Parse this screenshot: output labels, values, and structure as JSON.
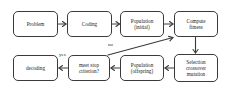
{
  "diagram": {
    "type": "flowchart",
    "nodes": [
      {
        "id": "problem",
        "label": "Problem"
      },
      {
        "id": "coding",
        "label": "Coding"
      },
      {
        "id": "population_initial",
        "label": "Population\n(initial)"
      },
      {
        "id": "compute_fitness",
        "label": "Compute\nfitness"
      },
      {
        "id": "selection",
        "label": "Selection\ncrossover\nmutation"
      },
      {
        "id": "population_offspring",
        "label": "Population\n(offspring)"
      },
      {
        "id": "stop_criterion",
        "label": "meet stop\ncriterion?"
      },
      {
        "id": "decoding",
        "label": "decoding"
      }
    ],
    "edges": [
      {
        "from": "problem",
        "to": "coding",
        "label": ""
      },
      {
        "from": "coding",
        "to": "population_initial",
        "label": ""
      },
      {
        "from": "population_initial",
        "to": "compute_fitness",
        "label": ""
      },
      {
        "from": "compute_fitness",
        "to": "selection",
        "label": ""
      },
      {
        "from": "selection",
        "to": "population_offspring",
        "label": ""
      },
      {
        "from": "population_offspring",
        "to": "stop_criterion",
        "label": ""
      },
      {
        "from": "stop_criterion",
        "to": "decoding",
        "label": "yes"
      },
      {
        "from": "stop_criterion",
        "to": "compute_fitness",
        "label": "no"
      }
    ],
    "edge_labels": {
      "yes": "yes",
      "no": "no"
    },
    "colors": {
      "stroke": "#3a3a3a",
      "text": "#222222",
      "background": "#ffffff"
    }
  }
}
